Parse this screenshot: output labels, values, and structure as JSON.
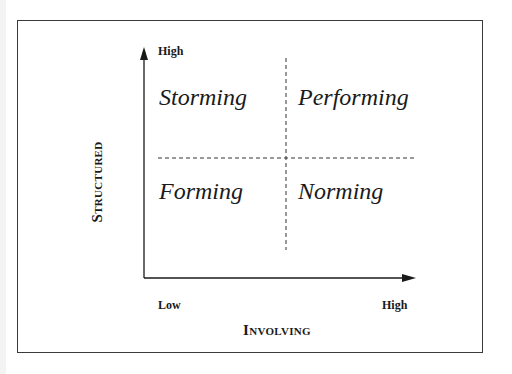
{
  "diagram": {
    "type": "2x2 matrix",
    "quadrants": {
      "top_left": "Storming",
      "top_right": "Performing",
      "bottom_left": "Forming",
      "bottom_right": "Norming"
    },
    "y_axis": {
      "title": "Structured",
      "high_label": "High"
    },
    "x_axis": {
      "title": "Involving",
      "low_label": "Low",
      "high_label": "High"
    },
    "colors": {
      "line": "#1a1a1a",
      "frame": "#3a3a3a",
      "background": "#ffffff"
    }
  }
}
